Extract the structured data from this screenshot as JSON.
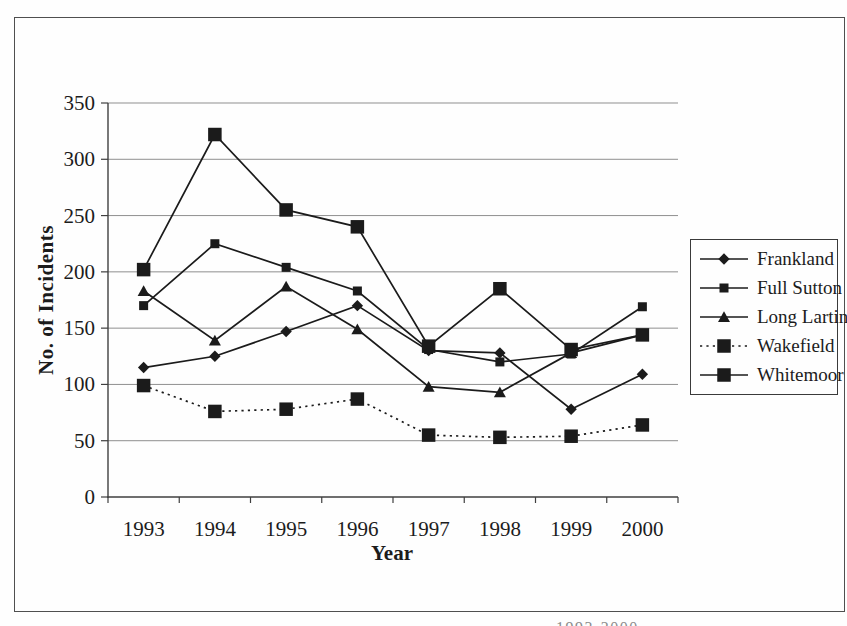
{
  "page": {
    "caption_fragment": "1993-2000"
  },
  "chart_data": {
    "type": "line",
    "title": "",
    "xlabel": "Year",
    "ylabel": "No. of Incidents",
    "ylim": [
      0,
      350
    ],
    "yticks": [
      0,
      50,
      100,
      150,
      200,
      250,
      300,
      350
    ],
    "grid": "horizontal",
    "legend_position": "right",
    "categories": [
      "1993",
      "1994",
      "1995",
      "1996",
      "1997",
      "1998",
      "1999",
      "2000"
    ],
    "series": [
      {
        "name": "Frankland",
        "marker": "diamond",
        "line": "solid",
        "values": [
          115,
          125,
          147,
          170,
          130,
          128,
          78,
          109
        ]
      },
      {
        "name": "Full Sutton",
        "marker": "square-small",
        "line": "solid",
        "values": [
          170,
          225,
          204,
          183,
          131,
          120,
          127,
          169
        ]
      },
      {
        "name": "Long Lartin",
        "marker": "triangle",
        "line": "solid",
        "values": [
          183,
          139,
          187,
          149,
          98,
          93,
          128,
          144
        ]
      },
      {
        "name": "Wakefield",
        "marker": "square-large",
        "line": "dotted",
        "values": [
          99,
          76,
          78,
          87,
          55,
          53,
          54,
          64
        ]
      },
      {
        "name": "Whitemoor",
        "marker": "square-large",
        "line": "solid",
        "values": [
          202,
          322,
          255,
          240,
          134,
          185,
          131,
          144
        ]
      }
    ],
    "series_color": "#1b1b1b",
    "gridline_color": "#8f8f8f",
    "axis_color": "#3f3f3f",
    "text_color": "#1c1c1c"
  }
}
